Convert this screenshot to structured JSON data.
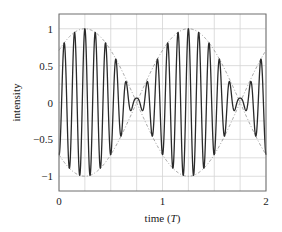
{
  "chart_data": {
    "type": "line",
    "title": "",
    "xlabel": "time (T)",
    "xlabel_parts": {
      "prefix": "time (",
      "var": "T",
      "suffix": ")"
    },
    "ylabel": "intensity",
    "xlim": [
      0,
      2
    ],
    "ylim": [
      -1.2,
      1.2
    ],
    "x_ticks": [
      0,
      1,
      2
    ],
    "x_tick_labels": [
      "0",
      "1",
      "2"
    ],
    "y_ticks": [
      -1,
      -0.5,
      0,
      0.5,
      1
    ],
    "y_tick_labels": [
      "−1",
      "−0.5",
      "0",
      "0.5",
      "1"
    ],
    "grid": true,
    "grid_x_step": 0.25,
    "grid_y_step": 0.25,
    "legend": null,
    "series": [
      {
        "name": "signal",
        "style": "solid",
        "color": "#2a2a2a",
        "description": "Amplitude-modulated oscillation, carrier ~10 cycles per T, envelope |cos(pi(t-0.25))| with small ringing near nodes",
        "carrier_cycles_per_T": 10,
        "envelope_peak_times": [
          0.25,
          1.25
        ],
        "envelope_node_times": [
          0.75,
          1.75
        ],
        "sample_points": [
          {
            "t": 0.0,
            "y": 0.55
          },
          {
            "t": 0.05,
            "y": -0.55
          },
          {
            "t": 0.15,
            "y": 0.85
          },
          {
            "t": 0.2,
            "y": -0.95
          },
          {
            "t": 0.25,
            "y": 1.0
          },
          {
            "t": 0.3,
            "y": -1.0
          },
          {
            "t": 0.35,
            "y": 0.95
          },
          {
            "t": 0.45,
            "y": 0.75
          },
          {
            "t": 0.55,
            "y": 0.4
          },
          {
            "t": 0.6,
            "y": -0.3
          },
          {
            "t": 0.65,
            "y": 0.15
          },
          {
            "t": 0.75,
            "y": 0.0
          },
          {
            "t": 0.85,
            "y": 0.05
          },
          {
            "t": 0.9,
            "y": -0.2
          },
          {
            "t": 0.95,
            "y": 0.45
          },
          {
            "t": 1.05,
            "y": 0.75
          },
          {
            "t": 1.25,
            "y": 1.0
          },
          {
            "t": 1.3,
            "y": -1.0
          },
          {
            "t": 1.45,
            "y": 0.75
          },
          {
            "t": 1.55,
            "y": 0.4
          },
          {
            "t": 1.65,
            "y": 0.15
          },
          {
            "t": 1.75,
            "y": 0.0
          },
          {
            "t": 1.85,
            "y": 0.05
          },
          {
            "t": 1.95,
            "y": 0.45
          },
          {
            "t": 2.0,
            "y": -0.5
          }
        ]
      },
      {
        "name": "envelope",
        "style": "dash-dot",
        "color": "#8a8a8a",
        "description": "Upper and lower envelope, +/-|cos(pi(t-0.25))|",
        "values_upper": [
          {
            "t": 0.0,
            "y": 0.71
          },
          {
            "t": 0.25,
            "y": 1.0
          },
          {
            "t": 0.5,
            "y": 0.71
          },
          {
            "t": 0.75,
            "y": 0.0
          },
          {
            "t": 1.0,
            "y": 0.71
          },
          {
            "t": 1.25,
            "y": 1.0
          },
          {
            "t": 1.5,
            "y": 0.71
          },
          {
            "t": 1.75,
            "y": 0.0
          },
          {
            "t": 2.0,
            "y": 0.71
          }
        ]
      }
    ]
  },
  "plot": {
    "left": 59,
    "right": 266,
    "top": 14,
    "bottom": 191
  }
}
